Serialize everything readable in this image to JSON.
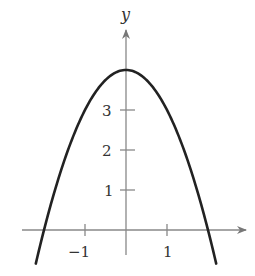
{
  "chart_data": {
    "type": "line",
    "title": "",
    "xlabel": "",
    "ylabel": "y",
    "function": "y = 4 - x^2",
    "x": [
      -2.2,
      -2,
      -1.5,
      -1,
      -0.5,
      0,
      0.5,
      1,
      1.5,
      2,
      2.2
    ],
    "series": [
      {
        "name": "parabola",
        "values": [
          -0.84,
          0,
          1.75,
          3,
          3.75,
          4,
          3.75,
          3,
          1.75,
          0,
          -0.84
        ]
      }
    ],
    "xticks": [
      -1,
      1
    ],
    "xtick_labels": [
      "−1",
      "1"
    ],
    "yticks": [
      1,
      2,
      3
    ],
    "ytick_labels": [
      "1",
      "2",
      "3"
    ],
    "xlim": [
      -2.3,
      3
    ],
    "ylim": [
      -0.8,
      4.7
    ],
    "grid": false,
    "legend": "none",
    "colors": {
      "curve": "#222222",
      "axis": "#777777"
    }
  }
}
